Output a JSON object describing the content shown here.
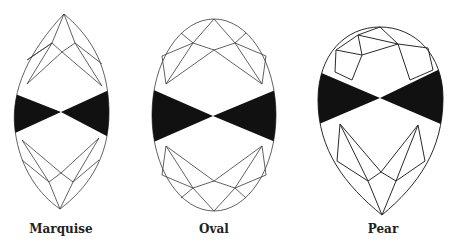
{
  "figure": {
    "shapes": [
      {
        "name": "Marquise",
        "feature": "bow-tie effect"
      },
      {
        "name": "Oval",
        "feature": "bow-tie effect"
      },
      {
        "name": "Pear",
        "feature": "bow-tie effect"
      }
    ],
    "colors": {
      "line": "#3a3a3a",
      "bowtie": "#111111",
      "background": "#ffffff"
    }
  }
}
